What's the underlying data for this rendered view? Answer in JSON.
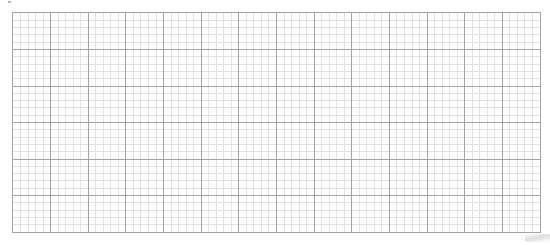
{
  "grid": {
    "major_columns": 14,
    "major_rows": 6,
    "minor_per_major": 5,
    "colors": {
      "background": "#ffffff",
      "major_line": "#a3a3a3",
      "minor_line": "#dcdcdc"
    }
  }
}
